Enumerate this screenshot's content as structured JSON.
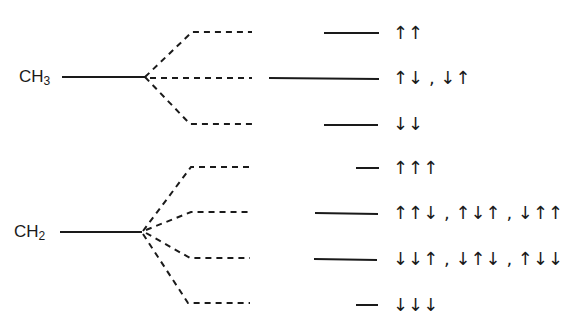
{
  "diagram": {
    "stroke_color": "#1a1a1a",
    "groups": [
      {
        "name": "CH3",
        "label_main": "CH",
        "label_sub": "3",
        "levels": [
          {
            "spin_states": "↑↑",
            "label": "↑↑"
          },
          {
            "spin_states": [
              "↑↓",
              "↓↑"
            ],
            "label": "↑↓ , ↓↑"
          },
          {
            "spin_states": "↓↓",
            "label": "↓↓"
          }
        ]
      },
      {
        "name": "CH2",
        "label_main": "CH",
        "label_sub": "2",
        "levels": [
          {
            "spin_states": "↑↑↑",
            "label": "↑↑↑"
          },
          {
            "spin_states": [
              "↑↑↓",
              "↑↓↑",
              "↓↑↑"
            ],
            "label": "↑↑↓ , ↑↓↑ , ↓↑↑"
          },
          {
            "spin_states": [
              "↓↓↑",
              "↓↑↓",
              "↑↓↓"
            ],
            "label": "↓↓↑ , ↓↑↓ , ↑↓↓"
          },
          {
            "spin_states": "↓↓↓",
            "label": "↓↓↓"
          }
        ]
      }
    ]
  }
}
